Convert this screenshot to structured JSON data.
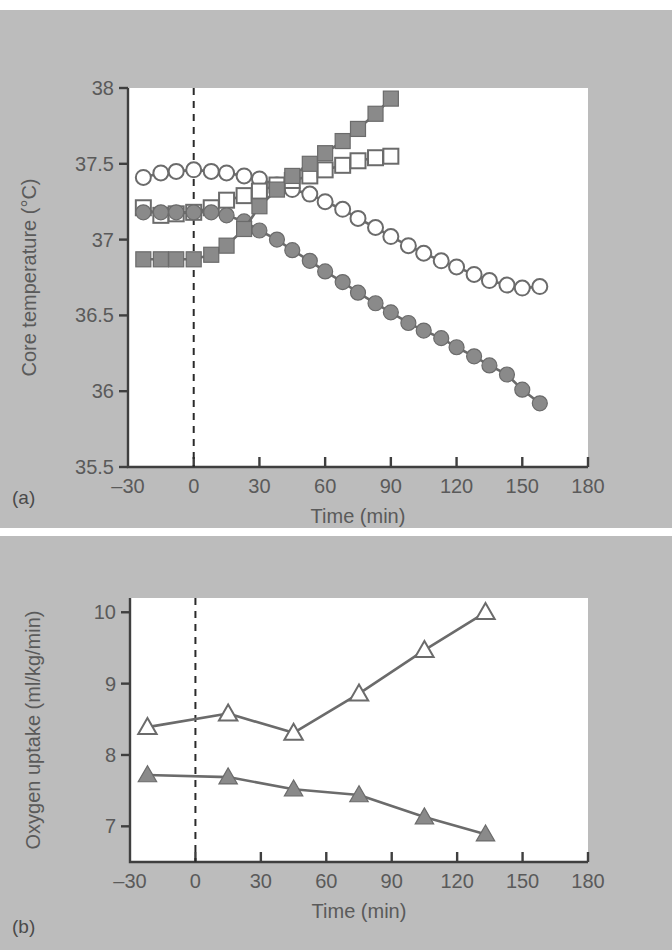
{
  "figure": {
    "panel_a_letter": "(a)",
    "panel_b_letter": "(b)",
    "background_color": "#bcbcbc",
    "plot_background_color": "#ffffff",
    "ink_color": "#6b6b6b",
    "marker_fill_color": "#8a8a8a",
    "text_color": "#5a5a5a"
  },
  "chart_data": [
    {
      "type": "line",
      "panel": "(a)",
      "title": "",
      "xlabel": "Time (min)",
      "ylabel": "Core temperature (°C)",
      "xlim": [
        -30,
        180
      ],
      "ylim": [
        35.5,
        38
      ],
      "xticks": [
        -30,
        0,
        30,
        60,
        90,
        120,
        150,
        180
      ],
      "xticklabels": [
        "–30",
        "0",
        "30",
        "60",
        "90",
        "120",
        "150",
        "180"
      ],
      "yticks": [
        35.5,
        36,
        36.5,
        37,
        37.5,
        38
      ],
      "yticklabels": [
        "35.5",
        "36",
        "36.5",
        "37",
        "37.5",
        "38"
      ],
      "grid": false,
      "legend": "none",
      "annotations": [
        {
          "type": "vline",
          "x": 0,
          "style": "dashed",
          "label": ""
        }
      ],
      "series": [
        {
          "name": "open-circle",
          "marker": "open-circle",
          "x": [
            -23,
            -15,
            -8,
            0,
            8,
            15,
            23,
            30,
            38,
            45,
            53,
            60,
            68,
            75,
            83,
            90,
            98,
            105,
            113,
            120,
            128,
            135,
            143,
            150,
            158
          ],
          "y": [
            37.41,
            37.44,
            37.45,
            37.46,
            37.45,
            37.44,
            37.42,
            37.4,
            37.36,
            37.33,
            37.3,
            37.25,
            37.2,
            37.14,
            37.08,
            37.02,
            36.96,
            36.91,
            36.86,
            36.82,
            36.77,
            36.73,
            36.7,
            36.68,
            36.69
          ]
        },
        {
          "name": "open-square",
          "marker": "open-square",
          "x": [
            -23,
            -15,
            -8,
            0,
            8,
            15,
            23,
            30,
            38,
            45,
            53,
            60,
            68,
            75,
            83,
            90
          ],
          "y": [
            37.21,
            37.16,
            37.17,
            37.18,
            37.21,
            37.26,
            37.29,
            37.32,
            37.36,
            37.39,
            37.42,
            37.46,
            37.49,
            37.52,
            37.54,
            37.55
          ]
        },
        {
          "name": "filled-circle",
          "marker": "filled-circle",
          "x": [
            -23,
            -15,
            -8,
            0,
            8,
            15,
            23,
            30,
            38,
            45,
            53,
            60,
            68,
            75,
            83,
            90,
            98,
            105,
            113,
            120,
            128,
            135,
            143,
            150,
            158
          ],
          "y": [
            37.18,
            37.18,
            37.18,
            37.18,
            37.18,
            37.16,
            37.12,
            37.06,
            37.0,
            36.93,
            36.86,
            36.79,
            36.72,
            36.65,
            36.58,
            36.52,
            36.45,
            36.4,
            36.35,
            36.29,
            36.23,
            36.17,
            36.11,
            36.01,
            35.92
          ]
        },
        {
          "name": "filled-square",
          "marker": "filled-square",
          "x": [
            -23,
            -15,
            -8,
            0,
            8,
            15,
            23,
            30,
            38,
            45,
            53,
            60,
            68,
            75,
            83,
            90
          ],
          "y": [
            36.87,
            36.87,
            36.87,
            36.87,
            36.9,
            36.96,
            37.07,
            37.22,
            37.33,
            37.42,
            37.5,
            37.57,
            37.65,
            37.73,
            37.83,
            37.93
          ]
        }
      ]
    },
    {
      "type": "line",
      "panel": "(b)",
      "title": "",
      "xlabel": "Time (min)",
      "ylabel": "Oxygen uptake (ml/kg/min)",
      "xlim": [
        -30,
        180
      ],
      "ylim": [
        6.5,
        10.2
      ],
      "xticks": [
        -30,
        0,
        30,
        60,
        90,
        120,
        150,
        180
      ],
      "xticklabels": [
        "–30",
        "0",
        "30",
        "60",
        "90",
        "120",
        "150",
        "180"
      ],
      "yticks": [
        7,
        8,
        9,
        10
      ],
      "yticklabels": [
        "7",
        "8",
        "9",
        "10"
      ],
      "grid": false,
      "legend": "none",
      "annotations": [
        {
          "type": "vline",
          "x": 0,
          "style": "dashed",
          "label": ""
        }
      ],
      "series": [
        {
          "name": "open-triangle",
          "marker": "open-triangle",
          "x": [
            -22,
            15,
            45,
            75,
            105,
            133
          ],
          "y": [
            8.39,
            8.58,
            8.31,
            8.86,
            9.47,
            10.0
          ]
        },
        {
          "name": "filled-triangle",
          "marker": "filled-triangle",
          "x": [
            -22,
            15,
            45,
            75,
            105,
            133
          ],
          "y": [
            7.72,
            7.69,
            7.52,
            7.44,
            7.13,
            6.89
          ]
        }
      ]
    }
  ]
}
